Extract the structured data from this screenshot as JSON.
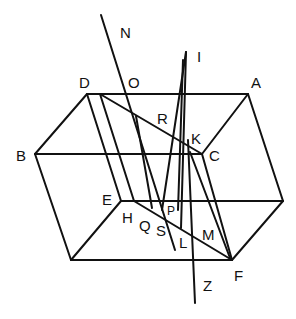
{
  "diagram": {
    "type": "geometric-figure",
    "stroke_color": "#111111",
    "background": "#ffffff",
    "labels": {
      "N": "N",
      "I": "I",
      "D": "D",
      "O": "O",
      "A": "A",
      "R": "R",
      "K": "K",
      "B": "B",
      "C": "C",
      "E": "E",
      "H": "H",
      "Q": "Q",
      "S": "S",
      "P": "P",
      "L": "L",
      "M": "M",
      "F": "F",
      "Z": "Z"
    }
  }
}
